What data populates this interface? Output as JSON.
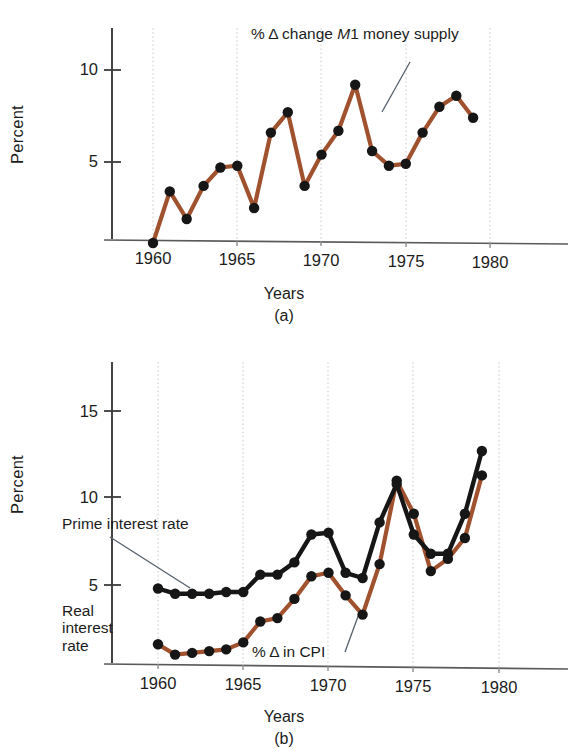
{
  "figure": {
    "background": "#ffffff",
    "series_colors": {
      "brown": "#a0512e",
      "black": "#161616"
    }
  },
  "panel_a": {
    "label": "(a)",
    "ylabel": "Percent",
    "xlabel": "Years",
    "annotation": {
      "prefix": "% Δ change ",
      "italic": "M",
      "suffix": "1 money supply"
    },
    "yticks": [
      "10",
      "5"
    ],
    "xticks": [
      "1960",
      "1965",
      "1970",
      "1975",
      "1980"
    ]
  },
  "panel_b": {
    "label": "(b)",
    "ylabel": "Percent",
    "xlabel": "Years",
    "annotation_prime": "Prime interest rate",
    "annotation_real": "Real\ninterest\nrate",
    "annotation_real_lines": [
      "Real",
      "interest",
      "rate"
    ],
    "annotation_cpi": "% Δ in CPI",
    "yticks": [
      "15",
      "10",
      "5"
    ],
    "xticks": [
      "1960",
      "1965",
      "1970",
      "1975",
      "1980"
    ]
  },
  "chart_data": [
    {
      "type": "line",
      "id": "panel_a",
      "title": "% Δ change M1 money supply",
      "xlabel": "Years",
      "ylabel": "Percent",
      "xlim": [
        1958.4,
        1981.2
      ],
      "ylim": [
        0.0,
        11.6
      ],
      "ytick_values": [
        5,
        10
      ],
      "xtick_values": [
        1960,
        1965,
        1970,
        1975,
        1980
      ],
      "grid": "vertical dotted at xticks",
      "legend": "none (inline annotation with leader line)",
      "marker": "filled circle",
      "line_color": "#a0512e",
      "x": [
        1960,
        1961,
        1962,
        1963,
        1964,
        1965,
        1966,
        1967,
        1968,
        1969,
        1970,
        1971,
        1972,
        1973,
        1974,
        1975,
        1976,
        1977,
        1978,
        1979
      ],
      "series": [
        {
          "name": "% Δ change M1 money supply",
          "color": "#a0512e",
          "values": [
            0.6,
            3.4,
            1.9,
            3.7,
            4.7,
            4.8,
            2.5,
            6.6,
            7.7,
            3.7,
            5.4,
            6.7,
            9.2,
            5.6,
            4.8,
            4.9,
            6.6,
            8.0,
            8.6,
            7.4
          ]
        }
      ]
    },
    {
      "type": "line",
      "id": "panel_b",
      "title": "Prime interest rate and % Δ in CPI",
      "xlabel": "Years",
      "ylabel": "Percent",
      "xlim": [
        1958.4,
        1981.2
      ],
      "ylim": [
        0.0,
        17.4
      ],
      "ytick_values": [
        5,
        10,
        15
      ],
      "xtick_values": [
        1960,
        1965,
        1970,
        1975,
        1980
      ],
      "grid": "vertical dotted at xticks",
      "legend": "none (inline annotations with leader lines)",
      "marker": "filled circle",
      "x": [
        1960,
        1961,
        1962,
        1963,
        1964,
        1965,
        1966,
        1967,
        1968,
        1969,
        1970,
        1971,
        1972,
        1973,
        1974,
        1975,
        1976,
        1977,
        1978,
        1979
      ],
      "series": [
        {
          "name": "Prime interest rate",
          "color": "#161616",
          "values": [
            4.8,
            4.5,
            4.5,
            4.5,
            4.6,
            4.6,
            5.6,
            5.6,
            6.3,
            7.9,
            8.0,
            5.7,
            5.4,
            8.6,
            10.8,
            7.9,
            6.8,
            6.8,
            9.1,
            12.7
          ]
        },
        {
          "name": "% Δ in CPI",
          "color": "#a0512e",
          "values": [
            1.6,
            1.0,
            1.1,
            1.2,
            1.3,
            1.7,
            2.9,
            3.1,
            4.2,
            5.5,
            5.7,
            4.4,
            3.3,
            6.2,
            11.0,
            9.1,
            5.8,
            6.5,
            7.7,
            11.3
          ]
        }
      ],
      "note": "Real interest rate = vertical gap between the black prime rate curve and the brown CPI curve"
    }
  ]
}
